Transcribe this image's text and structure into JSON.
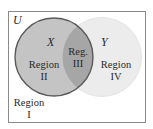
{
  "diagram": {
    "type": "venn",
    "universe_label": "U",
    "sets": [
      {
        "name": "X",
        "fill": "#c4c4c4",
        "stroke": "#5a5a5a"
      },
      {
        "name": "Y",
        "fill": "#ececec",
        "stroke": "#e4e4e4"
      }
    ],
    "intersection_fill": "#a6a6a6",
    "frame_stroke": "#8a8a8a",
    "background": "#ffffff",
    "regions": [
      {
        "id": "I",
        "line1": "Region",
        "line2": "I"
      },
      {
        "id": "II",
        "line1": "Region",
        "line2": "II"
      },
      {
        "id": "III",
        "line1": "Reg.",
        "line2": "III"
      },
      {
        "id": "IV",
        "line1": "Region",
        "line2": "IV"
      }
    ]
  }
}
